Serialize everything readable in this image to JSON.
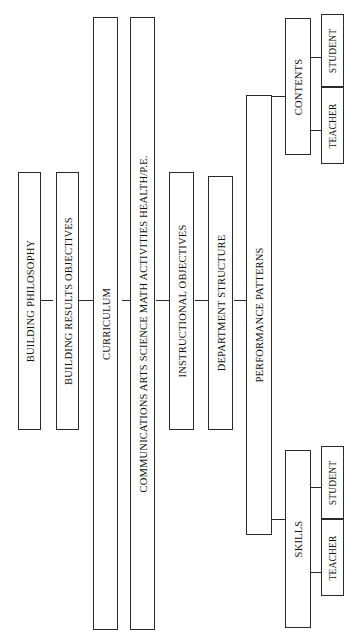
{
  "diagram": {
    "orientation": "rotated-90-ccw",
    "line_color": "#2b2b2b",
    "background_color": "#ffffff",
    "nodes": {
      "building_philosophy": "BUILDING PHILOSOPHY",
      "building_results_objectives": "BUILDING RESULTS OBJECTIVES",
      "curriculum": "CURRICULUM",
      "subject_areas": "COMMUNICATIONS   ARTS   SCIENCE   MATH   ACTIVITIES   HEALTH/P.E.",
      "instructional_objectives": "INSTRUCTIONAL OBJECTIVES",
      "department_structure": "DEPARTMENT STRUCTURE",
      "performance_patterns": "PERFORMANCE PATTERNS",
      "contents": "CONTENTS",
      "contents_teacher": "TEACHER",
      "contents_student": "STUDENT",
      "skills": "SKILLS",
      "skills_teacher": "TEACHER",
      "skills_student": "STUDENT"
    },
    "subject_list": [
      "COMMUNICATIONS",
      "ARTS",
      "SCIENCE",
      "MATH",
      "ACTIVITIES",
      "HEALTH/P.E."
    ]
  }
}
